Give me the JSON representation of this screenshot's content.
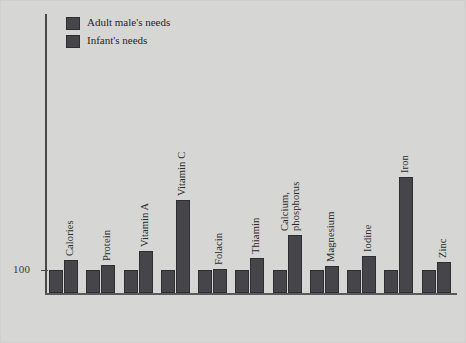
{
  "figure": {
    "background_color": "#d6d6d4",
    "bar_color": "#45454a",
    "axis_color": "#4a4a4c",
    "text_color": "#2b2b2d"
  },
  "legend": {
    "position": "top-left",
    "entries": [
      {
        "label": "Adult male's needs",
        "swatch_name": "legend-swatch-adult-male"
      },
      {
        "label": "Infant's needs",
        "swatch_name": "legend-swatch-infant"
      }
    ]
  },
  "axis": {
    "y_tick_label": "100"
  },
  "chart_data": {
    "type": "bar",
    "title": "",
    "subtitle": "",
    "xlabel": "",
    "ylabel": "",
    "grid": false,
    "legend_position": "top-left",
    "ylim": [
      0,
      560
    ],
    "baseline_value": 100,
    "ytick_labels": [
      "100"
    ],
    "ytick_values": [
      100
    ],
    "categories": [
      "Calories",
      "Protein",
      "Vitamin A",
      "Vitamin C",
      "Folacin",
      "Thiamin",
      "Calcium, phosphorus",
      "Magnesium",
      "Iodine",
      "Iron",
      "Zinc"
    ],
    "series": [
      {
        "name": "Adult male's needs",
        "values": [
          100,
          100,
          100,
          100,
          100,
          100,
          100,
          100,
          100,
          100,
          100
        ]
      },
      {
        "name": "Infant's needs",
        "values": [
          143,
          122,
          182,
          405,
          104,
          152,
          253,
          116,
          163,
          505,
          134
        ]
      }
    ],
    "annotations": []
  }
}
